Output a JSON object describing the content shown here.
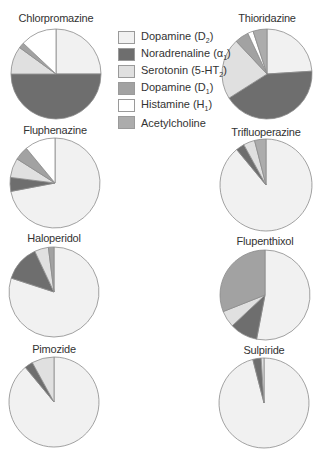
{
  "chart_data": {
    "type": "pie",
    "title": "",
    "legend": [
      {
        "key": "d2",
        "label": "Dopamine (D",
        "sub": "2",
        "suffix": ")",
        "color": "#f1f1f1"
      },
      {
        "key": "na",
        "label": "Noradrenaline (α",
        "sub": "1",
        "suffix": ")",
        "color": "#6e6e6e"
      },
      {
        "key": "ht",
        "label": "Serotonin (5-HT",
        "sub": "2",
        "suffix": ")",
        "color": "#e0e0e0"
      },
      {
        "key": "d1",
        "label": "Dopamine (D",
        "sub": "1",
        "suffix": ")",
        "color": "#a2a2a2"
      },
      {
        "key": "h1",
        "label": "Histamine (H",
        "sub": "1",
        "suffix": ")",
        "color": "#ffffff"
      },
      {
        "key": "ach",
        "label": "Acetylcholine",
        "sub": "",
        "suffix": "",
        "color": "#acacac"
      }
    ],
    "series_order": [
      "Dopamine (D2)",
      "Noradrenaline (α1)",
      "Serotonin (5-HT2)",
      "Dopamine (D1)",
      "Histamine (H1)",
      "Acetylcholine"
    ],
    "charts": [
      {
        "name": "Chlorpromazine",
        "cx": 56,
        "cy": 74,
        "r": 45,
        "title_y": 12,
        "values": [
          25,
          50,
          10,
          2,
          13,
          0
        ]
      },
      {
        "name": "Thioridazine",
        "cx": 267,
        "cy": 74,
        "r": 45,
        "title_y": 12,
        "values": [
          24,
          42,
          22,
          5,
          2,
          5
        ]
      },
      {
        "name": "Fluphenazine",
        "cx": 55,
        "cy": 183,
        "r": 45,
        "title_y": 124,
        "values": [
          72,
          5,
          7,
          5,
          11,
          0
        ]
      },
      {
        "name": "Trifluoperazine",
        "cx": 266,
        "cy": 185,
        "r": 46,
        "title_y": 126,
        "values": [
          89,
          3,
          4,
          0,
          0,
          4
        ]
      },
      {
        "name": "Haloperidol",
        "cx": 54,
        "cy": 292,
        "r": 45,
        "title_y": 232,
        "values": [
          80,
          13,
          5,
          2,
          0,
          0
        ]
      },
      {
        "name": "Flupenthixol",
        "cx": 265,
        "cy": 295,
        "r": 45,
        "title_y": 235,
        "values": [
          53,
          10,
          6,
          31,
          0,
          0
        ]
      },
      {
        "name": "Pimozide",
        "cx": 54,
        "cy": 402,
        "r": 45,
        "title_y": 343,
        "values": [
          89,
          3,
          8,
          0,
          0,
          0
        ]
      },
      {
        "name": "Sulpiride",
        "cx": 264,
        "cy": 403,
        "r": 45,
        "title_y": 344,
        "values": [
          96,
          3,
          1,
          0,
          0,
          0
        ]
      }
    ]
  }
}
